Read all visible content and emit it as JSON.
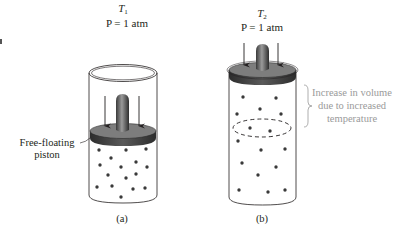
{
  "diagram": {
    "panel_a": {
      "temperature_symbol": "T",
      "temperature_sub": "1",
      "pressure_label": "P = 1 atm",
      "caption": "(a)",
      "piston_label_line1": "Free-floating",
      "piston_label_line2": "piston",
      "particles": [
        [
          99,
          150
        ],
        [
          126,
          150
        ],
        [
          146,
          149
        ],
        [
          111,
          158
        ],
        [
          136,
          162
        ],
        [
          100,
          165
        ],
        [
          121,
          167
        ],
        [
          147,
          167
        ],
        [
          108,
          175
        ],
        [
          126,
          178
        ],
        [
          136,
          174
        ],
        [
          97,
          187
        ],
        [
          112,
          186
        ],
        [
          133,
          189
        ],
        [
          145,
          188
        ],
        [
          121,
          197
        ]
      ]
    },
    "panel_b": {
      "temperature_symbol": "T",
      "temperature_sub": "2",
      "pressure_label": "P = 1 atm",
      "caption": "(b)",
      "annotation_line1": "Increase in volume",
      "annotation_line2": "due to increased",
      "annotation_line3": "temperature",
      "particles": [
        [
          243,
          97
        ],
        [
          276,
          98
        ],
        [
          237,
          114
        ],
        [
          260,
          109
        ],
        [
          281,
          114
        ],
        [
          250,
          128
        ],
        [
          270,
          131
        ],
        [
          238,
          141
        ],
        [
          261,
          150
        ],
        [
          285,
          149
        ],
        [
          242,
          163
        ],
        [
          276,
          167
        ],
        [
          258,
          175
        ],
        [
          239,
          190
        ],
        [
          268,
          192
        ],
        [
          285,
          190
        ]
      ]
    },
    "colors": {
      "line": "#231f20",
      "piston_top": "#7d7d7d",
      "piston_side": "#3d3d3d",
      "annotation_text": "#9a9a9a",
      "particle": "#3a3a3a"
    }
  }
}
